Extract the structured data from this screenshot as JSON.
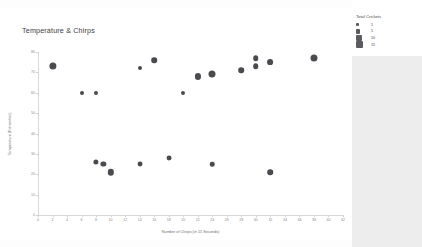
{
  "chart_data": {
    "type": "scatter",
    "title": "Temperature & Chirps",
    "xlabel": "Number of Chirps (in 15 Seconds)",
    "ylabel": "Temperature (Fahrenheit)",
    "xlim": [
      0,
      42
    ],
    "ylim": [
      0,
      80
    ],
    "xticks": [
      0,
      2,
      4,
      6,
      8,
      10,
      12,
      14,
      16,
      18,
      20,
      22,
      24,
      26,
      28,
      30,
      32,
      34,
      36,
      38,
      40,
      42
    ],
    "yticks": [
      0,
      10,
      20,
      30,
      40,
      50,
      60,
      70,
      80
    ],
    "grid": false,
    "legend_position": "right",
    "marker_color": "#4a4a4f",
    "size_field": "Total Crickets",
    "points": [
      {
        "x": 2,
        "y": 73,
        "size": 13
      },
      {
        "x": 6,
        "y": 60,
        "size": 2
      },
      {
        "x": 8,
        "y": 60,
        "size": 2
      },
      {
        "x": 8,
        "y": 26,
        "size": 5
      },
      {
        "x": 9,
        "y": 25,
        "size": 5
      },
      {
        "x": 10,
        "y": 21,
        "size": 9
      },
      {
        "x": 14,
        "y": 72,
        "size": 2
      },
      {
        "x": 14,
        "y": 25,
        "size": 4
      },
      {
        "x": 16,
        "y": 76,
        "size": 6
      },
      {
        "x": 18,
        "y": 28,
        "size": 4
      },
      {
        "x": 20,
        "y": 60,
        "size": 2
      },
      {
        "x": 22,
        "y": 68,
        "size": 8
      },
      {
        "x": 24,
        "y": 69,
        "size": 12
      },
      {
        "x": 24,
        "y": 25,
        "size": 3
      },
      {
        "x": 28,
        "y": 71,
        "size": 6
      },
      {
        "x": 30,
        "y": 77,
        "size": 6
      },
      {
        "x": 30,
        "y": 73,
        "size": 6
      },
      {
        "x": 32,
        "y": 75,
        "size": 7
      },
      {
        "x": 32,
        "y": 21,
        "size": 6
      },
      {
        "x": 38,
        "y": 77,
        "size": 12
      }
    ]
  },
  "legend": {
    "title": "Total Crickets",
    "entries": [
      {
        "label": "1",
        "swatch": 3.0
      },
      {
        "label": "5",
        "swatch": 4.2
      },
      {
        "label": "10",
        "swatch": 5.6
      },
      {
        "label": "15",
        "swatch": 7.0
      }
    ]
  }
}
